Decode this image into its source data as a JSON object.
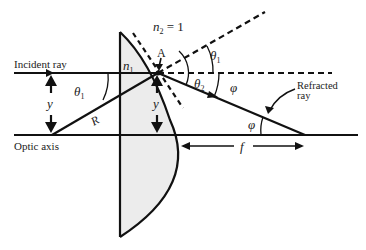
{
  "diagram": {
    "labels": {
      "incident_ray": "Incident ray",
      "optic_axis": "Optic axis",
      "refracted_ray_line1": "Refracted",
      "refracted_ray_line2": "ray",
      "n2": "n",
      "n2_sub": "2",
      "n2_eq": " = 1",
      "n1": "n",
      "n1_sub": "1",
      "point_A": "A",
      "theta1_left": "θ",
      "theta1_left_sub": "1",
      "theta1_right": "θ",
      "theta1_right_sub": "1",
      "theta2": "θ",
      "theta2_sub": "2",
      "phi_top": "φ",
      "phi_bottom": "φ",
      "R": "R",
      "y_left": "y",
      "y_right": "y",
      "f": "f"
    },
    "colors": {
      "line": "#111111",
      "lens_fill": "#ececec",
      "text": "#222222"
    }
  }
}
